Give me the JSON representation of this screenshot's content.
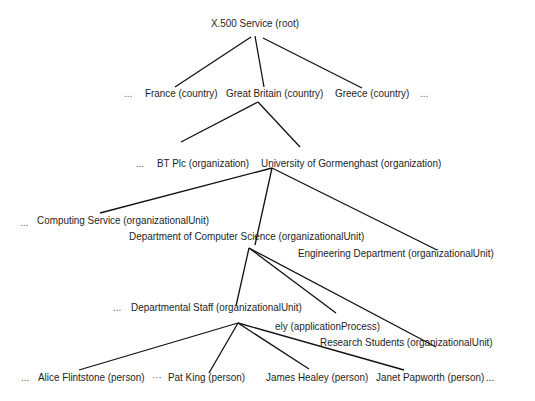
{
  "diagram": {
    "nodes": {
      "root": "X.500 Service (root)",
      "countries_left_ellipsis": "...",
      "france": "France (country)",
      "great_britain": "Great Britain (country)",
      "greece": "Greece (country)",
      "countries_right_ellipsis": "...",
      "orgs_ellipsis": "...",
      "bt": "BT Plc (organization)",
      "university": "University of Gormenghast (organization)",
      "ou_ellipsis": "...",
      "computing_service": "Computing Service (organizationalUnit)",
      "dept_cs": "Department of Computer Science (organizationalUnit)",
      "engineering": "Engineering Department (organizationalUnit)",
      "staff_ellipsis": "...",
      "departmental_staff": "Departmental Staff (organizationalUnit)",
      "ely": "ely (applicationProcess)",
      "research_students": "Research Students (organizationalUnit)",
      "persons_left_ellipsis": "...",
      "alice": "Alice Flintstone (person)",
      "persons_mid_ellipsis": "···",
      "pat": "Pat King (person)",
      "james": "James Healey (person)",
      "janet": "Janet Papworth (person)",
      "persons_right_ellipsis": "..."
    },
    "edges": [
      [
        "root",
        "france"
      ],
      [
        "root",
        "great_britain"
      ],
      [
        "root",
        "greece"
      ],
      [
        "great_britain",
        "bt"
      ],
      [
        "great_britain",
        "university"
      ],
      [
        "university",
        "computing_service"
      ],
      [
        "university",
        "dept_cs"
      ],
      [
        "university",
        "engineering"
      ],
      [
        "dept_cs",
        "departmental_staff"
      ],
      [
        "dept_cs",
        "ely"
      ],
      [
        "dept_cs",
        "research_students"
      ],
      [
        "departmental_staff",
        "alice"
      ],
      [
        "departmental_staff",
        "pat"
      ],
      [
        "departmental_staff",
        "james"
      ],
      [
        "departmental_staff",
        "janet"
      ]
    ],
    "colors": {
      "line": "#111111",
      "text": "#1e1e1e",
      "background": "#ffffff"
    }
  }
}
